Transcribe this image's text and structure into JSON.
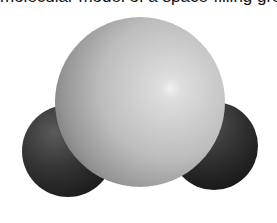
{
  "caption": {
    "text": "molecular model of a space-filling group",
    "clipped": true
  },
  "figure": {
    "atoms": [
      {
        "name": "left-atom",
        "shade": "#3a3a3a",
        "cx": 68,
        "cy": 151,
        "r": 46
      },
      {
        "name": "right-atom",
        "shade": "#3a3a3a",
        "cx": 214,
        "cy": 146,
        "r": 44
      },
      {
        "name": "central-atom",
        "shade": "#c8c8c8",
        "cx": 140,
        "cy": 102,
        "r": 85
      }
    ],
    "background": "#ffffff"
  }
}
